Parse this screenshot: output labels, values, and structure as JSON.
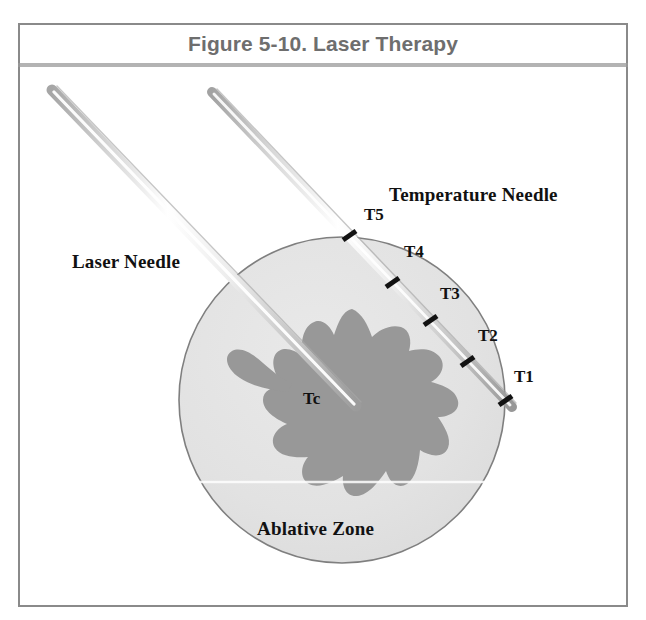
{
  "figure": {
    "caption": "Figure 5-10. Laser Therapy",
    "labels": {
      "laser_needle": "Laser Needle",
      "temperature_needle": "Temperature Needle",
      "ablative_zone": "Ablative Zone",
      "core_temperature": "Tc"
    },
    "temperature_sensors": [
      {
        "id": "T5",
        "label": "T5"
      },
      {
        "id": "T4",
        "label": "T4"
      },
      {
        "id": "T3",
        "label": "T3"
      },
      {
        "id": "T2",
        "label": "T2"
      },
      {
        "id": "T1",
        "label": "T1"
      }
    ],
    "colors": {
      "frame_border": "#8a8a8a",
      "caption_text": "#6e6e6e",
      "caption_rule": "#9a9a9a",
      "ablative_zone_fill": "#e3e3e3",
      "ablative_zone_stroke": "#7f7f7f",
      "necrosis_blob_fill": "#989898",
      "needle_light": "#ffffff",
      "needle_mid": "#d8d8d8",
      "needle_dark": "#9d9d9d",
      "sensor_tick": "#121212",
      "label_text": "#111111",
      "background": "#ffffff"
    }
  }
}
